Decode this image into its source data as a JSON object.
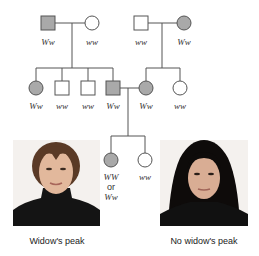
{
  "colors": {
    "affected_fill": "#a9a9a9",
    "unaffected_fill": "#ffffff",
    "line": "#555555"
  },
  "generation1": {
    "family_left": {
      "father": {
        "shape": "square",
        "affected": true,
        "genotype": "Ww"
      },
      "mother": {
        "shape": "circle",
        "affected": false,
        "genotype": "ww"
      }
    },
    "family_right": {
      "father": {
        "shape": "square",
        "affected": false,
        "genotype": "ww"
      },
      "mother": {
        "shape": "circle",
        "affected": true,
        "genotype": "Ww"
      }
    }
  },
  "generation2": {
    "left_children": [
      {
        "shape": "circle",
        "affected": true,
        "genotype": "Ww"
      },
      {
        "shape": "square",
        "affected": false,
        "genotype": "ww"
      },
      {
        "shape": "square",
        "affected": false,
        "genotype": "ww"
      },
      {
        "shape": "square",
        "affected": true,
        "genotype": "Ww"
      }
    ],
    "right_children": [
      {
        "shape": "circle",
        "affected": true,
        "genotype": "Ww"
      },
      {
        "shape": "circle",
        "affected": false,
        "genotype": "ww"
      }
    ]
  },
  "generation3": {
    "children": [
      {
        "shape": "circle",
        "affected": true,
        "genotype_line1": "WW",
        "genotype_or": "or",
        "genotype_line2": "Ww"
      },
      {
        "shape": "circle",
        "affected": false,
        "genotype": "ww"
      }
    ]
  },
  "photos": {
    "left_caption": "Widow's peak",
    "right_caption": "No widow's peak"
  }
}
